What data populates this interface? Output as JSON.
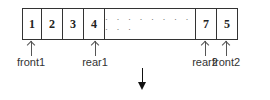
{
  "diagram": {
    "type": "double-stack-array",
    "cells": [
      {
        "value": "1",
        "width": 19
      },
      {
        "value": "2",
        "width": 21
      },
      {
        "value": "3",
        "width": 21
      },
      {
        "value": "4",
        "width": 21
      },
      {
        "value": "· · · · · · · · · · ·",
        "width": 91,
        "kind": "ellipsis"
      },
      {
        "value": "7",
        "width": 21
      },
      {
        "value": "5",
        "width": 21
      }
    ],
    "pointers": [
      {
        "label": "front1",
        "x": 31
      },
      {
        "label": "rear1",
        "x": 95
      },
      {
        "label": "rear2",
        "x": 205
      },
      {
        "label": "front2",
        "x": 226
      }
    ],
    "arrow": {
      "direction": "down"
    },
    "colors": {
      "border": "#333333",
      "text": "#222222",
      "arrow": "#111111"
    }
  }
}
